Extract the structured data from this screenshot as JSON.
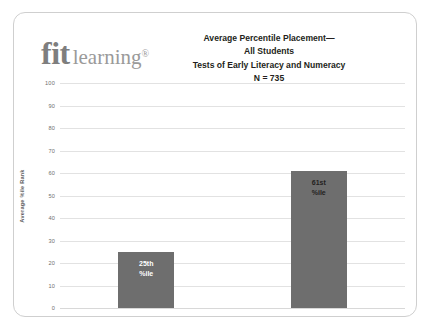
{
  "card": {
    "logo": {
      "primary": "fit",
      "secondary": "learning",
      "registered": "®"
    },
    "title": {
      "line1": "Average Percentile Placement—",
      "line2": "All Students",
      "line3": "Tests of Early Literacy and Numeracy",
      "line4": "N = 735"
    }
  },
  "chart_data": {
    "type": "bar",
    "title": "Average Percentile Placement— All Students Tests of Early Literacy and Numeracy N = 735",
    "xlabel": "",
    "ylabel": "Average %ile Rank",
    "ylim": [
      0,
      100
    ],
    "yticks": [
      0,
      10,
      20,
      30,
      40,
      50,
      60,
      70,
      80,
      90,
      100
    ],
    "ytick_labels": [
      "0",
      "10",
      "20",
      "30",
      "40",
      "50",
      "60",
      "70",
      "80",
      "90",
      "100"
    ],
    "grid": true,
    "legend": false,
    "sample_size": 735,
    "categories": [
      "Intake",
      "40 Hours"
    ],
    "values": [
      25,
      61
    ],
    "bar_color": "#6e6e6e",
    "bars": [
      {
        "category": "Intake",
        "value": 25,
        "label_line1": "25th",
        "label_line2": "%ile",
        "label_color": "#ffffff"
      },
      {
        "category": "40 Hours",
        "value": 61,
        "label_line1": "61st",
        "label_line2": "%ile",
        "label_color": "#231f20"
      }
    ]
  }
}
